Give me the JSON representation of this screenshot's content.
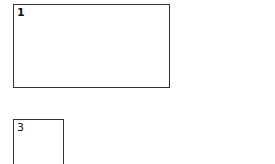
{
  "boxes": [
    {
      "id": "box-1",
      "label": "1"
    },
    {
      "id": "box-3",
      "label": "3"
    }
  ],
  "colors": {
    "border": "#333333",
    "text": "#111111",
    "background": "#ffffff"
  }
}
